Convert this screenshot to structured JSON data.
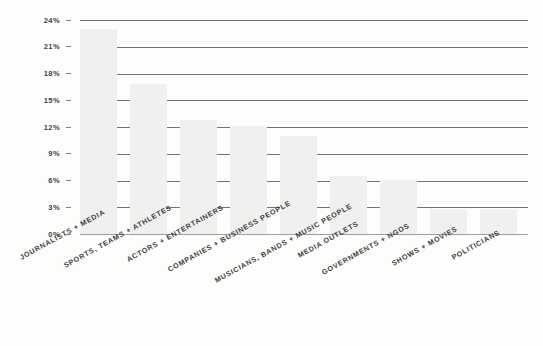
{
  "chart_data": {
    "type": "bar",
    "title": "",
    "subtitle": "",
    "xlabel": "",
    "ylabel": "",
    "ylim": [
      0,
      25
    ],
    "grid": true,
    "legend": null,
    "y_ticks": [
      "24%",
      "21%",
      "18%",
      "15%",
      "12%",
      "9%",
      "6%",
      "3%",
      "0%"
    ],
    "y_tick_values": [
      24,
      21,
      18,
      15,
      12,
      9,
      6,
      3,
      0
    ],
    "categories": [
      "JOURNALISTS + MEDIA",
      "SPORTS, TEAMS + ATHLETES",
      "ACTORS + ENTERTAINERS",
      "COMPANIES + BUSINESS PEOPLE",
      "MUSICIANS, BANDS + MUSIC PEOPLE",
      "MEDIA OUTLETS",
      "GOVERNMENTS + NGOS",
      "SHOWS + MOVIES",
      "POLITICIANS"
    ],
    "values": [
      24,
      17.5,
      13.3,
      12.6,
      11.4,
      6.8,
      6.3,
      2.9,
      2.9
    ],
    "bar_color": "#f0f0ee",
    "gridline_color": "#6f7476",
    "text_color": "#3a3f42",
    "background_color": "#fdfdfb"
  },
  "axis": {
    "tick_0": "24%",
    "tick_1": "21%",
    "tick_2": "18%",
    "tick_3": "15%",
    "tick_4": "12%",
    "tick_5": "9%",
    "tick_6": "6%",
    "tick_7": "3%",
    "tick_8": "0%"
  },
  "labels": {
    "cat_0": "JOURNALISTS + MEDIA",
    "cat_1": "SPORTS, TEAMS + ATHLETES",
    "cat_2": "ACTORS + ENTERTAINERS",
    "cat_3": "COMPANIES + BUSINESS PEOPLE",
    "cat_4": "MUSICIANS, BANDS + MUSIC PEOPLE",
    "cat_5": "MEDIA OUTLETS",
    "cat_6": "GOVERNMENTS + NGOS",
    "cat_7": "SHOWS + MOVIES",
    "cat_8": "POLITICIANS"
  }
}
